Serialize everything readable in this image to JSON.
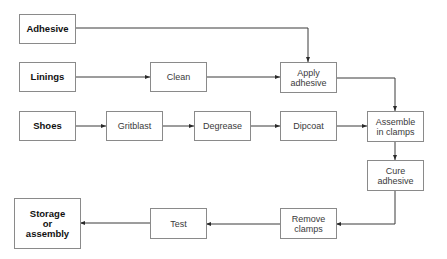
{
  "diagram": {
    "type": "process-flowchart",
    "nodes": [
      {
        "id": "adhesive",
        "label": "Adhesive",
        "kind": "input"
      },
      {
        "id": "linings",
        "label": "Linings",
        "kind": "input"
      },
      {
        "id": "shoes",
        "label": "Shoes",
        "kind": "input"
      },
      {
        "id": "clean",
        "label": "Clean",
        "kind": "step"
      },
      {
        "id": "apply_adhesive",
        "label": "Apply\nadhesive",
        "kind": "step"
      },
      {
        "id": "gritblast",
        "label": "Gritblast",
        "kind": "step"
      },
      {
        "id": "degrease",
        "label": "Degrease",
        "kind": "step"
      },
      {
        "id": "dipcoat",
        "label": "Dipcoat",
        "kind": "step"
      },
      {
        "id": "assemble",
        "label": "Assemble\nin clamps",
        "kind": "step"
      },
      {
        "id": "cure",
        "label": "Cure\nadhesive",
        "kind": "step"
      },
      {
        "id": "remove",
        "label": "Remove\nclamps",
        "kind": "step"
      },
      {
        "id": "test",
        "label": "Test",
        "kind": "step"
      },
      {
        "id": "storage",
        "label": "Storage\nor\nassembly",
        "kind": "output"
      }
    ],
    "edges": [
      {
        "from": "adhesive",
        "to": "apply_adhesive"
      },
      {
        "from": "linings",
        "to": "clean"
      },
      {
        "from": "clean",
        "to": "apply_adhesive"
      },
      {
        "from": "apply_adhesive",
        "to": "assemble"
      },
      {
        "from": "shoes",
        "to": "gritblast"
      },
      {
        "from": "gritblast",
        "to": "degrease"
      },
      {
        "from": "degrease",
        "to": "dipcoat"
      },
      {
        "from": "dipcoat",
        "to": "assemble"
      },
      {
        "from": "assemble",
        "to": "cure"
      },
      {
        "from": "cure",
        "to": "remove"
      },
      {
        "from": "remove",
        "to": "test"
      },
      {
        "from": "test",
        "to": "storage"
      }
    ],
    "colors": {
      "line": "#3a3a3a",
      "border": "#8a8a8a",
      "background": "#ffffff"
    }
  }
}
